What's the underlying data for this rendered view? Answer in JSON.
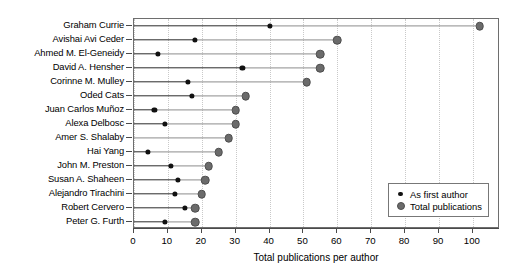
{
  "chart_data": {
    "type": "scatter",
    "subtype": "dumbbell-lollipop",
    "title": "",
    "xlabel": "Total publications per author",
    "ylabel": "",
    "xlim": [
      0,
      108
    ],
    "xticks": [
      0,
      10,
      20,
      30,
      40,
      50,
      60,
      70,
      80,
      90,
      100
    ],
    "xtick_labels": [
      "0",
      "10",
      "20",
      "30",
      "40",
      "50",
      "60",
      "70",
      "80",
      "90",
      "100"
    ],
    "grid": "vertical-dotted",
    "legend_position": "bottom-right",
    "categories": [
      "Graham Currie",
      "Avishai Avi Ceder",
      "Ahmed M. El-Geneidy",
      "David A. Hensher",
      "Corinne M. Mulley",
      "Oded Cats",
      "Juan Carlos Muñoz",
      "Alexa Delbosc",
      "Amer S. Shalaby",
      "Hai Yang",
      "John M. Preston",
      "Susan A. Shaheen",
      "Alejandro Tirachini",
      "Robert Cervero",
      "Peter G. Furth"
    ],
    "series": [
      {
        "name": "As first author",
        "color": "#111111",
        "values": [
          40,
          18,
          7,
          32,
          16,
          17,
          6,
          9,
          0,
          4,
          11,
          13,
          12,
          15,
          9
        ]
      },
      {
        "name": "Total publications",
        "color": "#6b6b6b",
        "values": [
          102,
          60,
          55,
          55,
          51,
          33,
          30,
          30,
          28,
          25,
          22,
          21,
          20,
          18,
          18
        ]
      }
    ]
  },
  "legend": {
    "items": [
      {
        "label": "As first author",
        "marker": "small-black-dot"
      },
      {
        "label": "Total publications",
        "marker": "large-gray-dot"
      }
    ]
  }
}
